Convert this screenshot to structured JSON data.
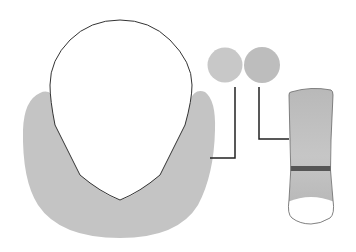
{
  "diagram": {
    "colors": {
      "background": "#ffffff",
      "u_region": "#c4c4c4",
      "head_fill": "#ffffff",
      "outline": "#333333",
      "swatch_left": "#c8c8c8",
      "swatch_right": "#bdbdbd",
      "callout_line": "#222222",
      "bar_fill": "#bcbcbc",
      "bar_band": "#555555",
      "bar_bottom": "#ffffff"
    },
    "elements": [
      {
        "name": "head-outline"
      },
      {
        "name": "gray-u-region"
      },
      {
        "name": "swatch-left"
      },
      {
        "name": "swatch-right"
      },
      {
        "name": "callout-left"
      },
      {
        "name": "callout-right"
      },
      {
        "name": "vertical-bar"
      }
    ]
  }
}
